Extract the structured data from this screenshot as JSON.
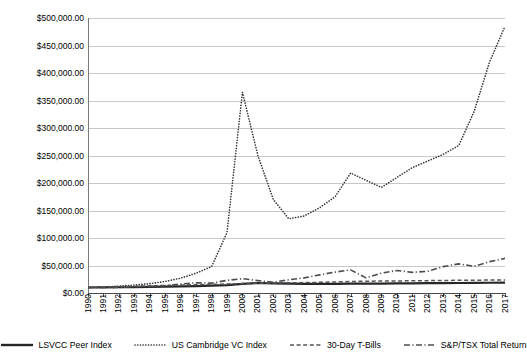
{
  "chart_data": {
    "type": "line",
    "title": "",
    "xlabel": "",
    "ylabel": "",
    "grid": true,
    "legend_position": "bottom",
    "x": [
      1990,
      1991,
      1992,
      1993,
      1994,
      1995,
      1996,
      1997,
      1998,
      1999,
      2000,
      2001,
      2002,
      2003,
      2004,
      2005,
      2006,
      2007,
      2008,
      2009,
      2010,
      2011,
      2012,
      2013,
      2014,
      2015,
      2016,
      2017
    ],
    "xtick_labels": [
      "1990",
      "1991",
      "1992",
      "1993",
      "1994",
      "1995",
      "1996",
      "1997",
      "1998",
      "1999",
      "2000",
      "2001",
      "2002",
      "2003",
      "2004",
      "2005",
      "2006",
      "2007",
      "2008",
      "2009",
      "2010",
      "2011",
      "2012",
      "2013",
      "2014",
      "2015",
      "2016",
      "2017"
    ],
    "ytick_labels": [
      "$0.00",
      "$50,000.00",
      "$100,000.00",
      "$150,000.00",
      "$200,000.00",
      "$250,000.00",
      "$300,000.00",
      "$350,000.00",
      "$400,000.00",
      "$450,000.00",
      "$500,000.00"
    ],
    "ytick_values": [
      0,
      50000,
      100000,
      150000,
      200000,
      250000,
      300000,
      350000,
      400000,
      450000,
      500000
    ],
    "ylim": [
      0,
      500000
    ],
    "xlim": [
      1990,
      2017
    ],
    "series": [
      {
        "name": "LSVCC Peer Index",
        "style": "solid",
        "color": "#262626",
        "width": 2.2,
        "values": [
          10000,
          10250,
          10500,
          10800,
          11200,
          11600,
          12000,
          12600,
          13300,
          14200,
          16500,
          18200,
          17600,
          17000,
          16700,
          16600,
          16700,
          16900,
          17100,
          17200,
          17400,
          17600,
          17800,
          18000,
          18200,
          18400,
          18600,
          18800
        ]
      },
      {
        "name": "US Cambridge VC Index",
        "style": "dotted",
        "color": "#333333",
        "width": 1.6,
        "values": [
          10000,
          11000,
          12500,
          14500,
          17000,
          21000,
          27000,
          36000,
          48000,
          110000,
          365000,
          250000,
          170000,
          135000,
          140000,
          155000,
          175000,
          218000,
          205000,
          192000,
          210000,
          228000,
          240000,
          252000,
          268000,
          330000,
          420000,
          485000
        ]
      },
      {
        "name": "30-Day T-Bills",
        "style": "dashed",
        "color": "#555555",
        "width": 1.5,
        "values": [
          10000,
          10900,
          11700,
          12300,
          12900,
          13700,
          14400,
          15000,
          15700,
          16300,
          17100,
          17800,
          18200,
          18600,
          18900,
          19400,
          20100,
          20900,
          21500,
          21700,
          21900,
          22200,
          22500,
          22800,
          23100,
          23300,
          23500,
          23700
        ]
      },
      {
        "name": "S&P/TSX Total Return",
        "style": "dashdot",
        "color": "#4d4d4d",
        "width": 1.6,
        "values": [
          10000,
          10100,
          10000,
          11600,
          12000,
          13400,
          16200,
          18500,
          18000,
          23000,
          26000,
          22500,
          19500,
          24000,
          27500,
          33000,
          38000,
          42000,
          27500,
          36000,
          41000,
          37500,
          39500,
          48000,
          53000,
          48500,
          57000,
          63000
        ]
      }
    ]
  },
  "legend": {
    "items": [
      {
        "label": "LSVCC Peer Index",
        "icon": "solid-line-icon"
      },
      {
        "label": "US Cambridge VC Index",
        "icon": "dotted-line-icon"
      },
      {
        "label": "30-Day T-Bills",
        "icon": "dashed-line-icon"
      },
      {
        "label": "S&P/TSX Total Return",
        "icon": "dashdot-line-icon"
      }
    ]
  }
}
